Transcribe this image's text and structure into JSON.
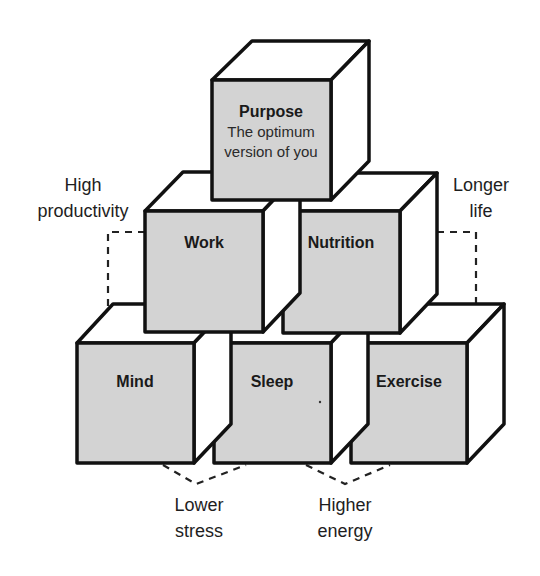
{
  "diagram": {
    "type": "cube-pyramid",
    "colors": {
      "front_face": "#d3d3d3",
      "top_side_face": "#ffffff",
      "outline": "#111111",
      "text": "#1a1a1a"
    },
    "cubes": {
      "purpose": {
        "title": "Purpose",
        "subtitle_line1": "The optimum",
        "subtitle_line2": "version of you",
        "row": 1
      },
      "work": {
        "title": "Work",
        "row": 2
      },
      "nutrition": {
        "title": "Nutrition",
        "row": 2
      },
      "mind": {
        "title": "Mind",
        "row": 3
      },
      "sleep": {
        "title": "Sleep",
        "row": 3
      },
      "exercise": {
        "title": "Exercise",
        "row": 3
      }
    },
    "outcomes": {
      "high_productivity": {
        "line1": "High",
        "line2": "productivity",
        "links": [
          "Work",
          "Mind"
        ]
      },
      "longer_life": {
        "line1": "Longer",
        "line2": "life",
        "links": [
          "Nutrition",
          "Exercise"
        ]
      },
      "lower_stress": {
        "line1": "Lower",
        "line2": "stress",
        "links": [
          "Mind",
          "Sleep"
        ]
      },
      "higher_energy": {
        "line1": "Higher",
        "line2": "energy",
        "links": [
          "Sleep",
          "Exercise"
        ]
      }
    }
  }
}
